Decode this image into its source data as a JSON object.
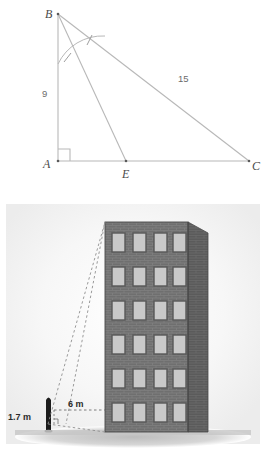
{
  "figures": [
    {
      "id": "triangle-diagram",
      "type": "geometry-diagram",
      "description": "Right triangle ABC with right angle at A, cevian BE to side AC, congruent angle marks at B",
      "vertices": [
        {
          "name": "B",
          "label": "B",
          "x": 58,
          "y": 14
        },
        {
          "name": "A",
          "label": "A",
          "x": 58,
          "y": 161
        },
        {
          "name": "E",
          "label": "E",
          "x": 126,
          "y": 161
        },
        {
          "name": "C",
          "label": "C",
          "x": 249,
          "y": 161
        }
      ],
      "side_labels": [
        {
          "name": "AB",
          "text": "9",
          "x": 46,
          "y": 94
        },
        {
          "name": "BC",
          "text": "15",
          "x": 182,
          "y": 79
        }
      ],
      "marks": {
        "right_angle_at": "A",
        "congruent_angle_arcs": 2,
        "angle_bisector_from": "B"
      },
      "colors": {
        "line": "#b3b3b3",
        "label_text": "#4a4a4a",
        "number_text": "#6b6b6b"
      }
    },
    {
      "id": "building-illustration",
      "type": "scene-illustration",
      "description": "Person of height 1.7 m standing 6 m from a six-storey brick building, dashed lines of sight to top and base of building",
      "measurements": [
        {
          "name": "person-height",
          "text": "1.7 m",
          "x": 10,
          "y": 417
        },
        {
          "name": "ground-distance",
          "text": "6 m",
          "x": 70,
          "y": 406
        }
      ],
      "building": {
        "window_rows": 6,
        "window_cols": 4,
        "front_face_color": "#6f6f6f",
        "side_face_color": "#5c5c5c",
        "brick_line_color": "#838383",
        "window_color": "#c9c9c9",
        "window_frame_color": "#595959"
      },
      "colors": {
        "ground_shadow": "#c9c9c9",
        "person": "#1a1a1a",
        "dashed_line": "#8c8c8c",
        "backdrop": "#f4f4f4"
      }
    }
  ]
}
